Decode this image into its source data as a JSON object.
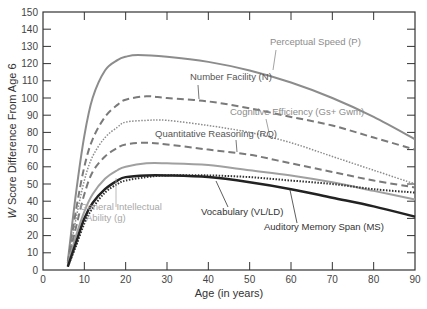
{
  "chart_data": {
    "type": "line",
    "title": "",
    "xlabel": "Age (in years)",
    "ylabel": "W Score Difference From Age 6",
    "xlim": [
      0,
      90
    ],
    "ylim": [
      0,
      150
    ],
    "xticks": [
      0,
      10,
      20,
      30,
      40,
      50,
      60,
      70,
      80,
      90
    ],
    "yticks": [
      0,
      10,
      20,
      30,
      40,
      50,
      60,
      70,
      80,
      90,
      100,
      110,
      120,
      130,
      140,
      150
    ],
    "grid": false,
    "series": [
      {
        "name": "Perceptual Speed (P)",
        "style": "solid",
        "color": "#8c8c8c",
        "width": 2,
        "x": [
          6,
          8,
          10,
          12,
          15,
          18,
          20,
          23,
          30,
          40,
          50,
          60,
          70,
          80,
          90
        ],
        "y": [
          5,
          45,
          78,
          100,
          116,
          122,
          124,
          125,
          124,
          121,
          116,
          109,
          100,
          89,
          76
        ]
      },
      {
        "name": "Number Facility (N)",
        "style": "dashed",
        "color": "#7a7a7a",
        "width": 2,
        "x": [
          6,
          8,
          10,
          12,
          15,
          18,
          20,
          25,
          30,
          40,
          50,
          60,
          70,
          80,
          90
        ],
        "y": [
          4,
          35,
          60,
          76,
          89,
          96,
          99,
          101,
          100,
          98,
          94,
          89,
          84,
          77,
          70
        ]
      },
      {
        "name": "Cognitive Efficiency (Gs + Gwm)",
        "style": "dotted",
        "color": "#8c8c8c",
        "width": 1.5,
        "x": [
          6,
          8,
          10,
          12,
          15,
          18,
          20,
          25,
          30,
          40,
          50,
          60,
          70,
          80,
          90
        ],
        "y": [
          4,
          30,
          52,
          66,
          77,
          83,
          86,
          87,
          87,
          84,
          80,
          74,
          66,
          58,
          50
        ]
      },
      {
        "name": "Quantitative Reasoning (RQ)",
        "style": "dashed",
        "color": "#7a7a7a",
        "width": 2,
        "x": [
          6,
          8,
          10,
          12,
          15,
          18,
          20,
          25,
          30,
          40,
          50,
          60,
          70,
          80,
          90
        ],
        "y": [
          4,
          25,
          44,
          57,
          66,
          71,
          73,
          74,
          73,
          70,
          67,
          62,
          57,
          52,
          48
        ]
      },
      {
        "name": "Vocabulary (VL/LD)",
        "style": "solid",
        "color": "#a0a0a0",
        "width": 2,
        "x": [
          6,
          8,
          10,
          12,
          15,
          18,
          20,
          25,
          30,
          40,
          50,
          60,
          70,
          80,
          90
        ],
        "y": [
          3,
          20,
          34,
          44,
          53,
          58,
          60,
          62,
          62,
          61,
          58,
          55,
          51,
          46,
          41
        ]
      },
      {
        "name": "General Intellectual Ability (g)",
        "style": "dotted",
        "color": "#333333",
        "width": 2,
        "x": [
          6,
          8,
          10,
          12,
          15,
          18,
          20,
          25,
          30,
          40,
          50,
          60,
          70,
          80,
          90
        ],
        "y": [
          2,
          14,
          27,
          36,
          45,
          50,
          52,
          54,
          55,
          55,
          54,
          52,
          50,
          47,
          45
        ]
      },
      {
        "name": "Auditory Memory Span (MS)",
        "style": "solid",
        "color": "#222222",
        "width": 2.5,
        "x": [
          6,
          8,
          10,
          12,
          15,
          18,
          20,
          25,
          30,
          40,
          50,
          60,
          70,
          80,
          90
        ],
        "y": [
          2,
          16,
          30,
          39,
          47,
          52,
          54,
          55,
          55,
          54,
          51,
          47,
          42,
          37,
          31
        ]
      }
    ],
    "annotations": [
      {
        "text": "Perceptual Speed (P)",
        "x": 270,
        "y": 45,
        "color": "#8c8c8c",
        "leader": [
          276,
          50,
          273,
          70
        ]
      },
      {
        "text": "Number Facility (N)",
        "x": 190,
        "y": 80,
        "color": "#555555",
        "leader": [
          198,
          85,
          199,
          99
        ]
      },
      {
        "text": "Cognitive Efficiency (Gs+ Gwm)",
        "x": 230,
        "y": 115,
        "color": "#8c8c8c",
        "leader": [
          266,
          119,
          270,
          137
        ]
      },
      {
        "text": "Quantitative Reasoning (RQ)",
        "x": 155,
        "y": 137,
        "color": "#555555",
        "leader": [
          236,
          140,
          237,
          152
        ]
      },
      {
        "text": "General Intellectual",
        "x": 80,
        "y": 210,
        "color": "#a8a8a8"
      },
      {
        "text": "Ability (g)",
        "x": 86,
        "y": 221,
        "color": "#a8a8a8",
        "leader": [
          116,
          207,
          116,
          178
        ]
      },
      {
        "text": "Vocabulary (VL/LD)",
        "x": 201,
        "y": 215,
        "color": "#333333",
        "leader": [
          228,
          207,
          216,
          181
        ]
      },
      {
        "text": "Auditory Memory Span (MS)",
        "x": 264,
        "y": 230,
        "color": "#333333",
        "leader": [
          297,
          223,
          290,
          190
        ]
      }
    ]
  },
  "axes": {
    "xlabel": "Age (in years)",
    "ylabel_prefix": "W",
    "ylabel_rest": " Score Difference From Age 6"
  }
}
